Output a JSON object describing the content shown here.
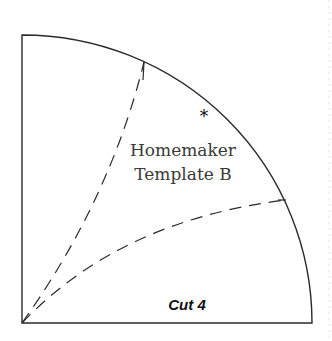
{
  "template": {
    "title_line1": "Homemaker",
    "title_line2": "Template B",
    "cut_label": "Cut 4",
    "marker_symbol": "*"
  },
  "colors": {
    "line": "#2a2a2a",
    "text": "#3a3a3a",
    "background": "#ffffff"
  }
}
